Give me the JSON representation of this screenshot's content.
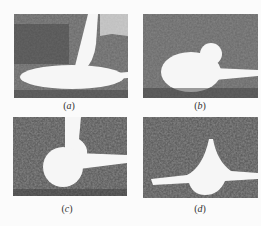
{
  "figure": {
    "panels": [
      {
        "id": "a",
        "label": "a",
        "description": "Flat elongated white blob with small plume on dark noisy background"
      },
      {
        "id": "b",
        "label": "b",
        "description": "Rounded white blob with bump on top and thin tail to right"
      },
      {
        "id": "c",
        "label": "c",
        "description": "Large round white blob with neck extending upward and thin tail to right"
      },
      {
        "id": "d",
        "label": "d",
        "description": "Peaked white shape with wide horizontal spread and rounded base"
      }
    ],
    "colors": {
      "background": "#fbfbfb",
      "noise_dark": "#3a3a3a",
      "noise_mid": "#7a7a7a",
      "foreground_white": "#f6f6f6"
    }
  }
}
